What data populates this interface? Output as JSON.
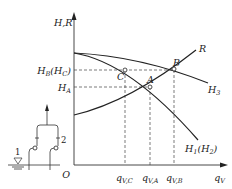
{
  "figure": {
    "type": "pump characteristic / system curve diagram",
    "y_axis_label": "H,R",
    "x_axis_label": "q_V",
    "origin_label": "O",
    "y_ticks": [
      {
        "label": "H_B(H_C)",
        "main": "H",
        "sub": "B",
        "paren_main": "H",
        "paren_sub": "C"
      },
      {
        "label": "H_A",
        "main": "H",
        "sub": "A"
      }
    ],
    "x_ticks": [
      {
        "label": "q_V,C",
        "main": "q",
        "sub": "V,C"
      },
      {
        "label": "q_V,A",
        "main": "q",
        "sub": "V,A"
      },
      {
        "label": "q_V,B",
        "main": "q",
        "sub": "V,B"
      }
    ],
    "curves": [
      {
        "id": "R",
        "label": "R",
        "description": "system resistance curve (rising)"
      },
      {
        "id": "H3",
        "label": "H_3",
        "main": "H",
        "sub": "3",
        "description": "combined pump curve (upper)"
      },
      {
        "id": "H1H2",
        "label": "H_1(H_2)",
        "main": "H",
        "sub": "1",
        "paren_main": "H",
        "paren_sub": "2",
        "description": "single pump curve"
      }
    ],
    "points": [
      {
        "label": "A",
        "description": "operating point on H_1 and R"
      },
      {
        "label": "B",
        "description": "operating point on H_3 and R"
      },
      {
        "label": "C",
        "description": "point on H_1 at H_B level"
      }
    ],
    "inset": {
      "labels": [
        "1",
        "2"
      ],
      "description": "two pumps in parallel drawing from a reservoir"
    }
  }
}
